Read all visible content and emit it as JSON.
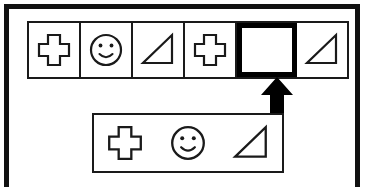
{
  "figure": {
    "frame": {
      "name": "outer-border",
      "color": "#111111"
    }
  },
  "sequence": {
    "name": "pattern-strip",
    "cell_count": 6,
    "cells": [
      {
        "index": 1,
        "shape": "cross",
        "label": "cross",
        "state": "filled"
      },
      {
        "index": 2,
        "shape": "smiley",
        "label": "smiley face",
        "state": "filled"
      },
      {
        "index": 3,
        "shape": "triangle",
        "label": "right triangle",
        "state": "filled"
      },
      {
        "index": 4,
        "shape": "cross",
        "label": "cross",
        "state": "filled"
      },
      {
        "index": 5,
        "shape": "none",
        "label": "empty answer slot",
        "state": "empty-highlighted"
      },
      {
        "index": 6,
        "shape": "triangle",
        "label": "right triangle",
        "state": "filled"
      }
    ]
  },
  "options": {
    "name": "answer-options",
    "items": [
      {
        "index": 1,
        "shape": "cross",
        "label": "cross"
      },
      {
        "index": 2,
        "shape": "smiley",
        "label": "smiley face"
      },
      {
        "index": 3,
        "shape": "triangle",
        "label": "right triangle"
      }
    ]
  },
  "connector": {
    "name": "up-arrow",
    "label": "arrow pointing from options box to empty slot",
    "direction": "up",
    "color": "#000000"
  },
  "colors": {
    "stroke": "#1a1a1a",
    "frame": "#111111",
    "highlight": "#000000",
    "background": "#ffffff"
  }
}
